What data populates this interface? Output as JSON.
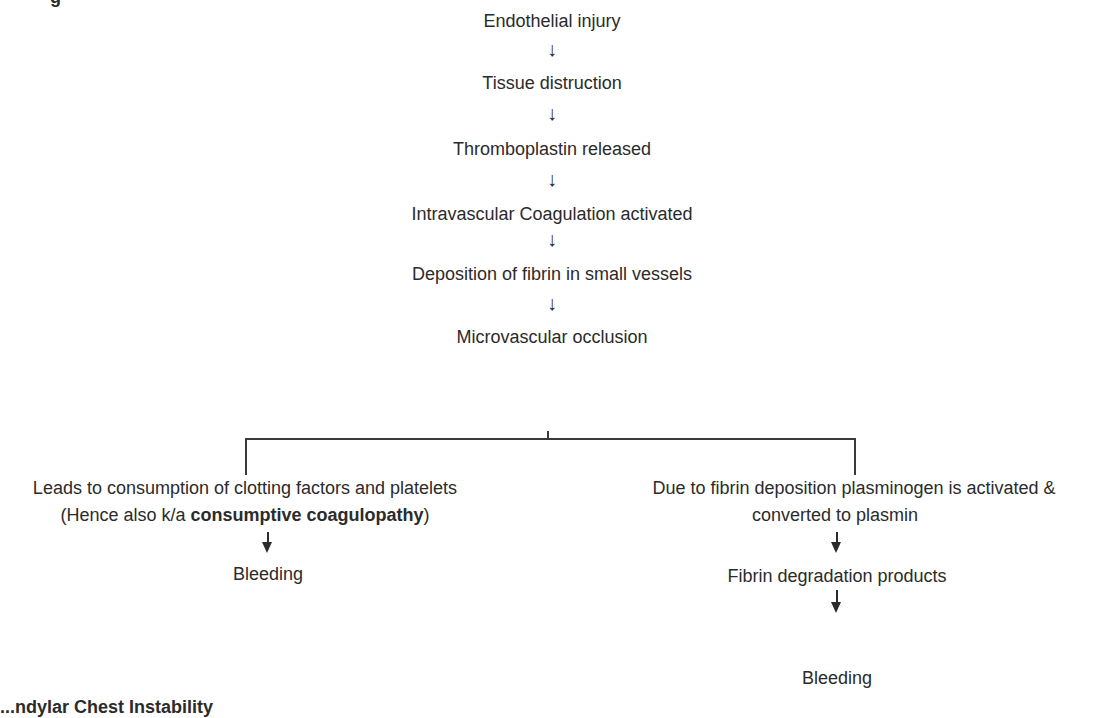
{
  "diagram": {
    "top_fragment": "g",
    "chain": [
      {
        "label": "Endothelial injury"
      },
      {
        "label": "Tissue distruction"
      },
      {
        "label": "Thromboplastin released"
      },
      {
        "label": "Intravascular Coagulation activated"
      },
      {
        "label": "Deposition of fibrin in small vessels"
      },
      {
        "label": "Microvascular occlusion"
      }
    ],
    "arrow_glyph": "↓",
    "left_branch": {
      "line1": "Leads to consumption of clotting factors and platelets",
      "line2_prefix": "(Hence also k/a ",
      "line2_bold": "consumptive coagulopathy",
      "line2_suffix": ")",
      "outcome": "Bleeding"
    },
    "right_branch": {
      "line1": "Due to fibrin deposition plasminogen is activated &",
      "line2": "converted to plasmin",
      "step": "Fibrin degradation products",
      "outcome": "Bleeding"
    },
    "bottom_fragment": "...ndylar Chest Instability"
  }
}
